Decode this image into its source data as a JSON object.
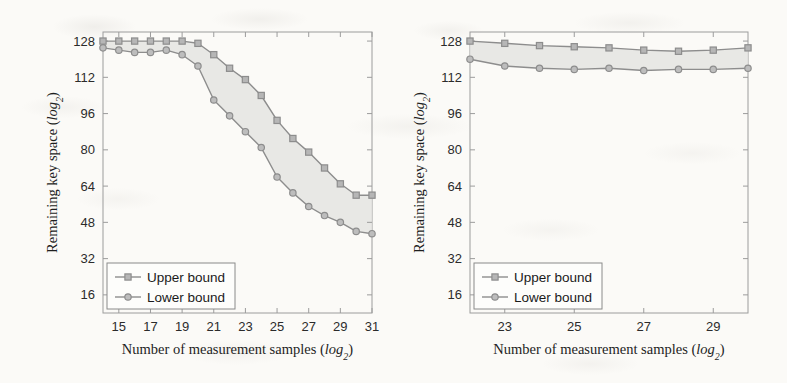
{
  "figure": {
    "background_color": "#fbfaf7",
    "line_color": "#8d8d8d",
    "marker_color": "#9a9a9a",
    "fill_color": "#e4e4e2",
    "axis_color": "#9c9c9c",
    "text_color": "#2b2b2b"
  },
  "chart_data": [
    {
      "type": "line",
      "id": "left-chart",
      "title": "",
      "xlabel": "Number of measurement samples (log2)",
      "ylabel": "Remaining key space (log2)",
      "xlabel_parts": {
        "main": "Number of measurement samples (",
        "italic": "log",
        "sub": "2",
        "close": ")"
      },
      "ylabel_parts": {
        "main": "Remaining key space (",
        "italic": "log",
        "sub": "2",
        "close": ")"
      },
      "xlim": [
        14,
        31
      ],
      "ylim": [
        8,
        132
      ],
      "xticks": [
        15,
        17,
        19,
        21,
        23,
        25,
        27,
        29,
        31
      ],
      "xtick_labels": [
        "15",
        "17",
        "19",
        "21",
        "23",
        "25",
        "27",
        "29",
        "31"
      ],
      "yticks": [
        16,
        32,
        48,
        64,
        80,
        96,
        112,
        128
      ],
      "ytick_labels": [
        "16",
        "32",
        "48",
        "64",
        "80",
        "96",
        "112",
        "128"
      ],
      "grid": false,
      "legend_position": "lower left",
      "x": [
        14,
        15,
        16,
        17,
        18,
        19,
        20,
        21,
        22,
        23,
        24,
        25,
        26,
        27,
        28,
        29,
        30,
        31
      ],
      "series": [
        {
          "name": "Upper bound",
          "marker": "square",
          "values": [
            128,
            128,
            128,
            128,
            128,
            128,
            127,
            122,
            116,
            111,
            104,
            93,
            85,
            79,
            72,
            65,
            60,
            60,
            51
          ]
        },
        {
          "name": "Lower bound",
          "marker": "circle",
          "values": [
            125,
            124,
            123,
            123,
            124,
            122,
            117,
            102,
            95,
            88,
            81,
            68,
            61,
            55,
            51,
            48,
            44,
            43,
            37
          ]
        }
      ],
      "series_values": {
        "upper": [
          128,
          128,
          128,
          128,
          128,
          128,
          127,
          122,
          116,
          111,
          104,
          93,
          85,
          79,
          72,
          65,
          60,
          51
        ],
        "lower": [
          125,
          124,
          123,
          123,
          124,
          122,
          117,
          102,
          95,
          88,
          81,
          68,
          61,
          55,
          51,
          44,
          43,
          37
        ]
      },
      "legend": [
        {
          "label": "Upper bound",
          "marker": "square"
        },
        {
          "label": "Lower bound",
          "marker": "circle"
        }
      ]
    },
    {
      "type": "line",
      "id": "right-chart",
      "title": "",
      "xlabel": "Number of measurement samples (log2)",
      "ylabel": "Remaining key space (log2)",
      "xlabel_parts": {
        "main": "Number of measurement samples (",
        "italic": "log",
        "sub": "2",
        "close": ")"
      },
      "ylabel_parts": {
        "main": "Remaining key space (",
        "italic": "log",
        "sub": "2",
        "close": ")"
      },
      "xlim": [
        22,
        30
      ],
      "ylim": [
        8,
        132
      ],
      "xticks": [
        23,
        25,
        27,
        29
      ],
      "xtick_labels": [
        "23",
        "25",
        "27",
        "29"
      ],
      "yticks": [
        16,
        32,
        48,
        64,
        80,
        96,
        112,
        128
      ],
      "ytick_labels": [
        "16",
        "32",
        "48",
        "64",
        "80",
        "96",
        "112",
        "128"
      ],
      "grid": false,
      "legend_position": "lower left",
      "x": [
        22,
        23,
        24,
        25,
        26,
        27,
        28,
        29,
        30
      ],
      "series": [
        {
          "name": "Upper bound",
          "marker": "square",
          "values": [
            128,
            127,
            126,
            125.5,
            125,
            124,
            123.5,
            124,
            125
          ]
        },
        {
          "name": "Lower bound",
          "marker": "circle",
          "values": [
            120,
            117,
            116,
            115.5,
            116,
            115,
            115.5,
            115.5,
            116
          ]
        }
      ],
      "series_values": {
        "upper": [
          128,
          127,
          126,
          125.5,
          125,
          124,
          123.5,
          124,
          125
        ],
        "lower": [
          120,
          117,
          116,
          115.5,
          116,
          115,
          115.5,
          115.5,
          116
        ]
      },
      "legend": [
        {
          "label": "Upper bound",
          "marker": "square"
        },
        {
          "label": "Lower bound",
          "marker": "circle"
        }
      ]
    }
  ]
}
